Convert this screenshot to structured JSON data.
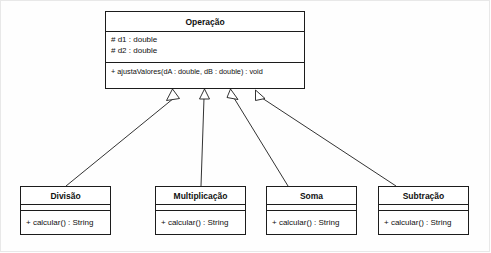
{
  "diagram": {
    "kind": "uml-class-diagram",
    "background_color": "#fefefe",
    "line_color": "#1c1c1c",
    "text_color": "#101010"
  },
  "parent_class": {
    "name": "Operação",
    "attributes": [
      "# d1 : double",
      "# d2 : double"
    ],
    "operations": [
      "+ ajustaValores(dA : double, dB : double) : void"
    ]
  },
  "subclasses": [
    {
      "name": "Divisão",
      "attributes": [],
      "operations": [
        "+ calcular() : String"
      ]
    },
    {
      "name": "Multiplicação",
      "attributes": [],
      "operations": [
        "+ calcular() : String"
      ]
    },
    {
      "name": "Soma",
      "attributes": [],
      "operations": [
        "+ calcular() : String"
      ]
    },
    {
      "name": "Subtração",
      "attributes": [],
      "operations": [
        "+ calcular() : String"
      ]
    }
  ],
  "relationships": {
    "type": "generalization",
    "arrowhead": "hollow-triangle",
    "edges": [
      {
        "from": "Divisão",
        "to": "Operação"
      },
      {
        "from": "Multiplicação",
        "to": "Operação"
      },
      {
        "from": "Soma",
        "to": "Operação"
      },
      {
        "from": "Subtração",
        "to": "Operação"
      }
    ]
  }
}
